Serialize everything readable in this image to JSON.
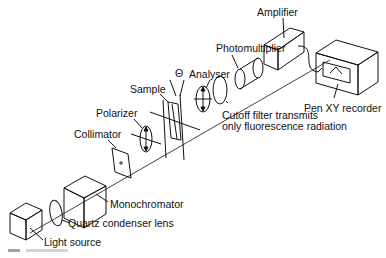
{
  "diagram": {
    "labels": {
      "light_source": "Light source",
      "quartz_lens": "Quartz condenser lens",
      "monochromator": "Monochromator",
      "collimator": "Collimator",
      "polarizer": "Polarizer",
      "sample": "Sample",
      "theta": "Θ",
      "analyser": "Analyser",
      "cutoff_filter_line1": "Cutoff filter transmits",
      "cutoff_filter_line2": "only fluorescence radiation",
      "photomultiplier": "Photomultiplier",
      "amplifier": "Amplifier",
      "recorder": "Pen XY recorder"
    },
    "caption": "Fig."
  }
}
